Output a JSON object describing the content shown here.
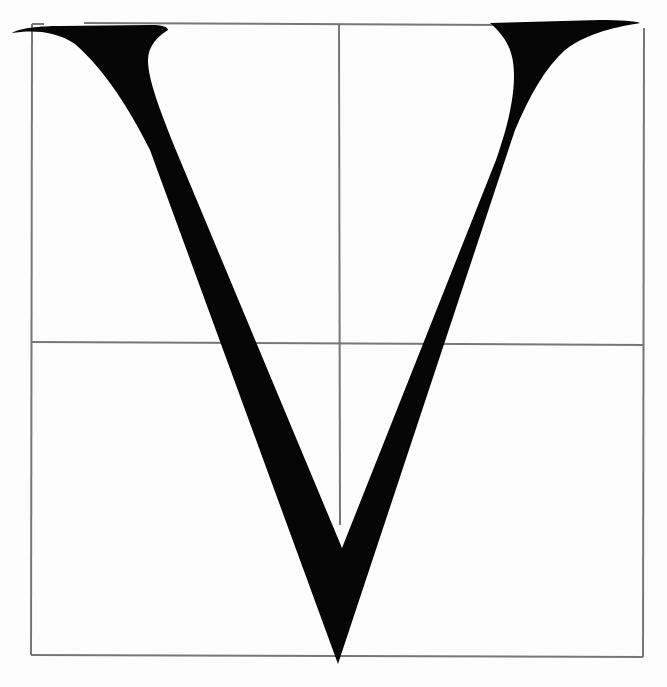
{
  "specimen": {
    "glyph": "V",
    "description": "Serif capital V letterform drawn on a construction grid",
    "colors": {
      "background": "#fdfdfd",
      "grid": "#777777",
      "glyph": "#050505"
    },
    "grid": {
      "outer_box": {
        "left": 32,
        "top": 24,
        "right": 640,
        "bottom": 655
      },
      "horizontal_midline_y": 342,
      "vertical_midline_x": 340,
      "vertical_midline_from_y": 24,
      "vertical_midline_to_y": 525
    },
    "glyph_geometry": {
      "left_serif_tip": [
        12,
        33
      ],
      "right_serif_tip": [
        640,
        22
      ],
      "apex": [
        338,
        664
      ],
      "inner_vertex": [
        342,
        548
      ]
    }
  }
}
